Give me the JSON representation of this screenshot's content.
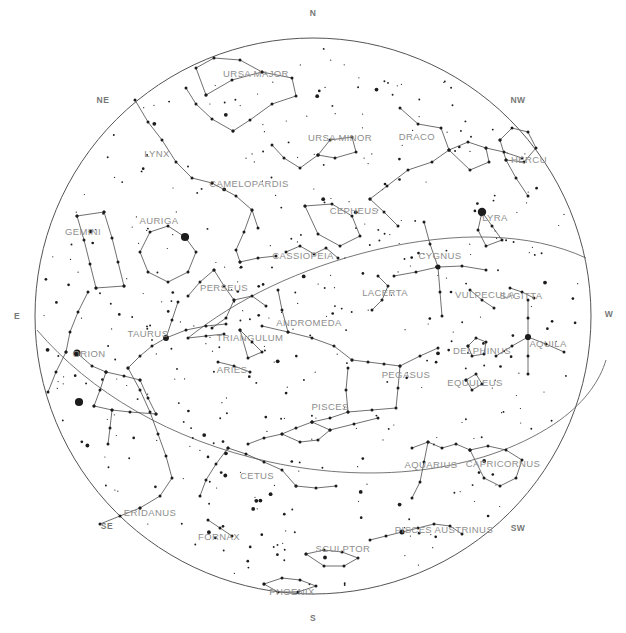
{
  "chart_data": {
    "type": "scatter",
    "projection": "stereographic-zenithal",
    "horizon": {
      "cx": 313,
      "cy": 316,
      "r": 278
    },
    "xlabel": "",
    "ylabel": "",
    "grid": false,
    "legend_position": "none",
    "cardinals": [
      {
        "label": "N",
        "x": 313,
        "y": 14
      },
      {
        "label": "NE",
        "x": 103,
        "y": 101
      },
      {
        "label": "NW",
        "x": 518,
        "y": 101
      },
      {
        "label": "E",
        "x": 17,
        "y": 317
      },
      {
        "label": "W",
        "x": 609,
        "y": 315
      },
      {
        "label": "SE",
        "x": 107,
        "y": 527
      },
      {
        "label": "SW",
        "x": 518,
        "y": 529
      },
      {
        "label": "S",
        "x": 313,
        "y": 619
      }
    ],
    "constellations": [
      {
        "name": "URSA MAJOR",
        "x": 256,
        "y": 74
      },
      {
        "name": "URSA MINOR",
        "x": 340,
        "y": 138
      },
      {
        "name": "DRACO",
        "x": 417,
        "y": 137
      },
      {
        "name": "HERCU",
        "x": 529,
        "y": 160
      },
      {
        "name": "LYNX",
        "x": 157,
        "y": 154
      },
      {
        "name": "CAMELOPARDIS",
        "x": 249,
        "y": 184
      },
      {
        "name": "CEPHEUS",
        "x": 354,
        "y": 211
      },
      {
        "name": "LYRA",
        "x": 495,
        "y": 218
      },
      {
        "name": "AURIGA",
        "x": 159,
        "y": 221
      },
      {
        "name": "GEMINI",
        "x": 83,
        "y": 232
      },
      {
        "name": "CASSIOPEIA",
        "x": 303,
        "y": 256
      },
      {
        "name": "CYGNUS",
        "x": 440,
        "y": 256
      },
      {
        "name": "PERSEUS",
        "x": 224,
        "y": 288
      },
      {
        "name": "LACERTA",
        "x": 385,
        "y": 293
      },
      {
        "name": "VULPECULA",
        "x": 485,
        "y": 295
      },
      {
        "name": "SAGITTA",
        "x": 521,
        "y": 296
      },
      {
        "name": "ANDROMEDA",
        "x": 309,
        "y": 323
      },
      {
        "name": "TAURUS",
        "x": 148,
        "y": 334
      },
      {
        "name": "TRIANGULUM",
        "x": 250,
        "y": 338
      },
      {
        "name": "DELPHINUS",
        "x": 482,
        "y": 351
      },
      {
        "name": "AQUILA",
        "x": 548,
        "y": 344
      },
      {
        "name": "ORION",
        "x": 89,
        "y": 354
      },
      {
        "name": "ARIES",
        "x": 232,
        "y": 370
      },
      {
        "name": "PEGASUS",
        "x": 406,
        "y": 375
      },
      {
        "name": "EQUULEUS",
        "x": 475,
        "y": 383
      },
      {
        "name": "PISCES",
        "x": 330,
        "y": 407
      },
      {
        "name": "CETUS",
        "x": 257,
        "y": 476
      },
      {
        "name": "AQUARIUS",
        "x": 431,
        "y": 465
      },
      {
        "name": "CAPRICORNUS",
        "x": 503,
        "y": 464
      },
      {
        "name": "ERIDANUS",
        "x": 150,
        "y": 513
      },
      {
        "name": "PISCES AUSTRINUS",
        "x": 444,
        "y": 530
      },
      {
        "name": "FORNAX",
        "x": 219,
        "y": 537
      },
      {
        "name": "SCULPTOR",
        "x": 343,
        "y": 549
      },
      {
        "name": "PHOENIX",
        "x": 292,
        "y": 592
      }
    ],
    "star_count_approx": 420,
    "brightest_stars": [
      {
        "name": "Vega",
        "x": 482,
        "y": 212,
        "mag": 0.0
      },
      {
        "name": "Capella",
        "x": 185,
        "y": 237,
        "mag": 0.1
      },
      {
        "name": "Aldebaran",
        "x": 166,
        "y": 338,
        "mag": 0.9
      },
      {
        "name": "Rigel",
        "x": 79,
        "y": 402,
        "mag": 0.1
      },
      {
        "name": "Betelgeuse",
        "x": 77,
        "y": 353,
        "mag": 0.5
      },
      {
        "name": "Altair",
        "x": 528,
        "y": 337,
        "mag": 0.8
      },
      {
        "name": "Deneb",
        "x": 438,
        "y": 267,
        "mag": 1.2
      },
      {
        "name": "Fomalhaut",
        "x": 402,
        "y": 532,
        "mag": 1.2
      }
    ]
  },
  "colors": {
    "background": "#ffffff",
    "horizon_stroke": "#555555",
    "constellation_line": "#4a4a4a",
    "star_fill": "#1c1c1c",
    "label_text": "#8e8e8e",
    "cardinal_text": "#777777"
  }
}
